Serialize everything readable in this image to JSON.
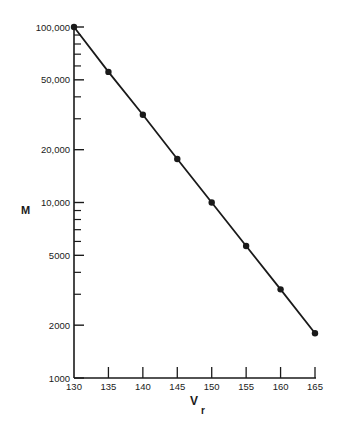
{
  "chart_data": {
    "type": "line",
    "title": "",
    "xlabel": "V",
    "xlabel_subscript": "r",
    "ylabel": "M",
    "yscale": "log",
    "xlim": [
      130,
      165
    ],
    "ylim": [
      1000,
      100000
    ],
    "x": [
      130,
      135,
      140,
      145,
      150,
      155,
      160,
      165
    ],
    "series": [
      {
        "name": "M vs Vr",
        "values": [
          100000,
          55500,
          31600,
          17700,
          10000,
          5650,
          3200,
          1800
        ],
        "marker": "circle",
        "color": "#1a1a1a"
      }
    ],
    "x_ticks": [
      130,
      135,
      140,
      145,
      150,
      155,
      160,
      165
    ],
    "x_tick_labels": [
      "130",
      "135",
      "140",
      "145",
      "150",
      "155",
      "160",
      "165"
    ],
    "y_ticks_major": [
      100000,
      50000,
      20000,
      10000,
      5000,
      2000,
      1000
    ],
    "y_tick_labels": [
      "100,000",
      "50,000",
      "20,000",
      "10,000",
      "5000",
      "2000",
      "1000"
    ],
    "y_ticks_minor": [
      90000,
      80000,
      70000,
      60000,
      40000,
      30000,
      9000,
      8000,
      7000,
      6000,
      4000,
      3000
    ],
    "grid": false,
    "legend": "none"
  }
}
